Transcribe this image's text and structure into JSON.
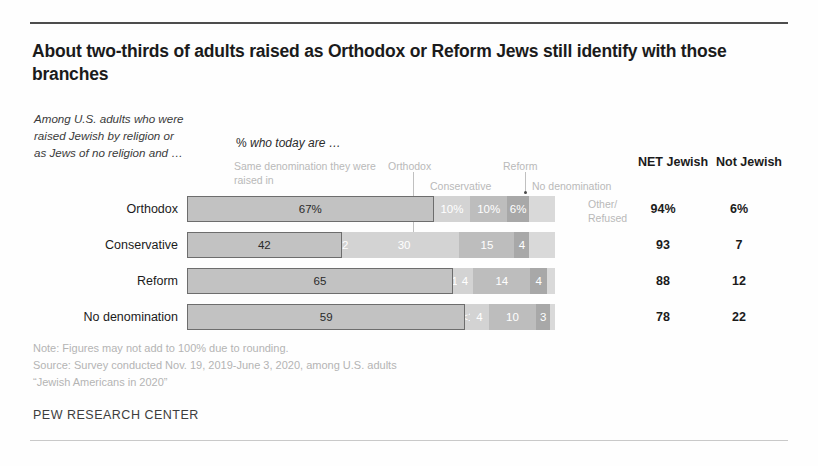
{
  "title": "About two-thirds of adults raised as Orthodox or Reform Jews still identify with those branches",
  "subnote": "Among U.S. adults who were raised Jewish by religion or as Jews of no religion and …",
  "pct_header_prefix": "%",
  "pct_header_italic": "who today are …",
  "legend": {
    "same": "Same denomination they were raised in",
    "orthodox": "Orthodox",
    "conservative": "Conservative",
    "reform": "Reform",
    "no_denomination": "No denomination",
    "other_refused": "Other/ Refused"
  },
  "net_headers": {
    "net_jewish": "NET Jewish",
    "not_jewish": "Not Jewish"
  },
  "footnotes": {
    "note": "Note: Figures may not add to 100% due to rounding.",
    "source": "Source: Survey conducted Nov. 19, 2019-June 3, 2020, among U.S. adults",
    "report": "“Jewish Americans in 2020”"
  },
  "pew": "PEW RESEARCH CENTER",
  "chart_data": {
    "type": "bar",
    "title": "About two-thirds of adults raised as Orthodox or Reform Jews still identify with those branches",
    "subtitle": "% who today are …",
    "orientation": "horizontal",
    "stacked": true,
    "xlabel": "",
    "ylabel": "",
    "xlim": [
      0,
      100
    ],
    "grid": false,
    "legend_position": "top",
    "categories": [
      "Orthodox",
      "Conservative",
      "Reform",
      "No denomination"
    ],
    "series": [
      {
        "name": "Same denomination they were raised in",
        "values": [
          67,
          42,
          65,
          59
        ],
        "labels": [
          "67%",
          "42",
          "65",
          "59"
        ],
        "color": "#c2c2c2"
      },
      {
        "name": "Orthodox",
        "values": [
          0,
          2,
          1,
          0.5
        ],
        "labels": [
          "",
          "2",
          "1",
          "<1"
        ],
        "color": "#d3d3d3"
      },
      {
        "name": "Conservative",
        "values": [
          10,
          30,
          4,
          4
        ],
        "labels": [
          "10%",
          "30",
          "4",
          "4"
        ],
        "color": "#d3d3d3"
      },
      {
        "name": "Reform",
        "values": [
          10,
          15,
          14,
          10
        ],
        "labels": [
          "10%",
          "15",
          "14",
          "10"
        ],
        "color": "#bdbdbd"
      },
      {
        "name": "No denomination",
        "values": [
          6,
          4,
          4,
          3
        ],
        "labels": [
          "6%",
          "4",
          "4",
          "3"
        ],
        "color": "#a8a8a8"
      },
      {
        "name": "Other/ Refused",
        "values": [
          0,
          0,
          0,
          0
        ],
        "labels": [
          "",
          "",
          "",
          ""
        ],
        "color": "#d9d9d9"
      }
    ],
    "net_jewish": [
      "94%",
      "93",
      "88",
      "78"
    ],
    "not_jewish": [
      "6%",
      "7",
      "12",
      "22"
    ]
  },
  "rows": [
    {
      "label": "Orthodox",
      "segments": [
        {
          "name": "same",
          "value": 67,
          "text": "67%",
          "style": "same"
        },
        {
          "name": "orthodox",
          "value": 0,
          "text": "",
          "style": "s-a"
        },
        {
          "name": "conservative",
          "value": 10,
          "text": "10%",
          "style": "s-a"
        },
        {
          "name": "reform",
          "value": 10,
          "text": "10%",
          "style": "s-b"
        },
        {
          "name": "no-denomination",
          "value": 6,
          "text": "6%",
          "style": "s-c"
        },
        {
          "name": "other-refused",
          "value": 7,
          "text": "",
          "style": "s-d"
        }
      ],
      "net_jewish": "94%",
      "not_jewish": "6%"
    },
    {
      "label": "Conservative",
      "segments": [
        {
          "name": "same",
          "value": 42,
          "text": "42",
          "style": "same"
        },
        {
          "name": "orthodox",
          "value": 2,
          "text": "2",
          "style": "s-a"
        },
        {
          "name": "conservative",
          "value": 30,
          "text": "30",
          "style": "s-a"
        },
        {
          "name": "reform",
          "value": 15,
          "text": "15",
          "style": "s-b"
        },
        {
          "name": "no-denomination",
          "value": 4,
          "text": "4",
          "style": "s-c"
        },
        {
          "name": "other-refused",
          "value": 7,
          "text": "",
          "style": "s-d"
        }
      ],
      "net_jewish": "93",
      "not_jewish": "7"
    },
    {
      "label": "Reform",
      "segments": [
        {
          "name": "same",
          "value": 65,
          "text": "65",
          "style": "same"
        },
        {
          "name": "orthodox",
          "value": 1,
          "text": "1",
          "style": "s-a"
        },
        {
          "name": "conservative",
          "value": 4,
          "text": "4",
          "style": "s-a"
        },
        {
          "name": "reform",
          "value": 14,
          "text": "14",
          "style": "s-b"
        },
        {
          "name": "no-denomination",
          "value": 4,
          "text": "4",
          "style": "s-c"
        },
        {
          "name": "other-refused",
          "value": 2,
          "text": "",
          "style": "s-d"
        }
      ],
      "net_jewish": "88",
      "not_jewish": "12"
    },
    {
      "label": "No denomination",
      "segments": [
        {
          "name": "same",
          "value": 59,
          "text": "59",
          "style": "same"
        },
        {
          "name": "orthodox",
          "value": 1,
          "text": "<1",
          "style": "s-a"
        },
        {
          "name": "conservative",
          "value": 4,
          "text": "4",
          "style": "s-a"
        },
        {
          "name": "reform",
          "value": 10,
          "text": "10",
          "style": "s-b"
        },
        {
          "name": "no-denomination",
          "value": 3,
          "text": "3",
          "style": "s-c"
        },
        {
          "name": "other-refused",
          "value": 1,
          "text": "",
          "style": "s-d"
        }
      ],
      "net_jewish": "78",
      "not_jewish": "22"
    }
  ]
}
